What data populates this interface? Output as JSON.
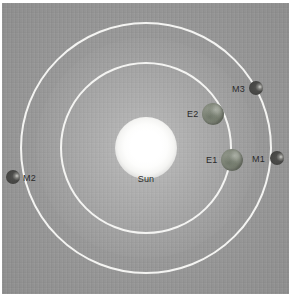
{
  "figure": {
    "title": "",
    "type": "orbital-diagram",
    "background_color": "#9a9a9a",
    "orbit_color": "#f4f4f2"
  },
  "star": {
    "name": "sun",
    "label": "Sun",
    "color": "#ffffff",
    "center": {
      "x": 146,
      "y": 148
    },
    "radius": 31
  },
  "orbits": [
    {
      "name": "inner-orbit",
      "radius": 86,
      "center": {
        "x": 146,
        "y": 148
      }
    },
    {
      "name": "outer-orbit",
      "radius": 126,
      "center": {
        "x": 146,
        "y": 148
      }
    }
  ],
  "bodies": [
    {
      "id": "E1",
      "label": "E1",
      "kind": "planet",
      "orbit": "inner-orbit",
      "color": "#8b9184",
      "size": 22,
      "center": {
        "x": 232,
        "y": 160
      },
      "label_pos": {
        "x": 206,
        "y": 155
      }
    },
    {
      "id": "E2",
      "label": "E2",
      "kind": "planet",
      "orbit": "inner-orbit",
      "color": "#8b9184",
      "size": 22,
      "center": {
        "x": 213,
        "y": 114
      },
      "label_pos": {
        "x": 187,
        "y": 109
      }
    },
    {
      "id": "M1",
      "label": "M1",
      "kind": "moon",
      "orbit": "outer-orbit",
      "color": "#474745",
      "size": 14,
      "center": {
        "x": 277,
        "y": 158
      },
      "label_pos": {
        "x": 252,
        "y": 154
      }
    },
    {
      "id": "M2",
      "label": "M2",
      "kind": "moon",
      "orbit": "outer-orbit",
      "color": "#474745",
      "size": 14,
      "center": {
        "x": 13,
        "y": 177
      },
      "label_pos": {
        "x": 23,
        "y": 173
      }
    },
    {
      "id": "M3",
      "label": "M3",
      "kind": "moon",
      "orbit": "outer-orbit",
      "color": "#474745",
      "size": 14,
      "center": {
        "x": 256,
        "y": 88
      },
      "label_pos": {
        "x": 232,
        "y": 84
      }
    }
  ]
}
